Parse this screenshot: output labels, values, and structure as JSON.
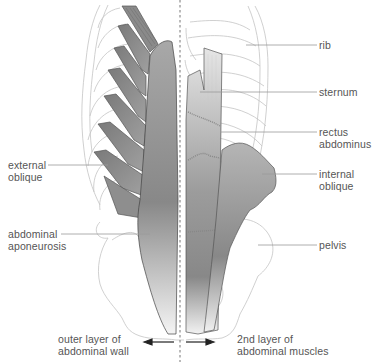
{
  "diagram": {
    "type": "anatomical illustration"
  },
  "labels": {
    "rib": "rib",
    "sternum": "sternum",
    "rectus_abdominus": "rectus\nabdominus",
    "internal_oblique": "internal\noblique",
    "pelvis": "pelvis",
    "external_oblique": "external\noblique",
    "abdominal_aponeurosis": "abdominal\naponeurosis",
    "outer_layer": "outer layer of\nabdominal wall",
    "second_layer": "2nd layer of\nabdominal muscles"
  },
  "colors": {
    "outline": "#bdbdbd",
    "muscle_dark": "#6e6e6e",
    "muscle_mid": "#9a9a9a",
    "muscle_light": "#d8d8d8",
    "leader": "#999999",
    "text": "#555555",
    "arrow": "#222222"
  }
}
